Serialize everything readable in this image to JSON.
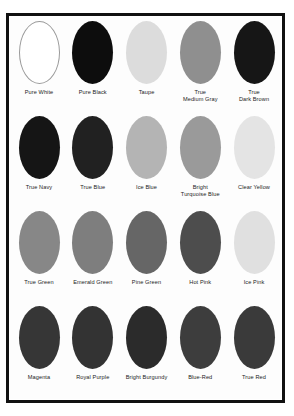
{
  "page": {
    "kind": "color-swatch-chart",
    "frame_color": "#111111",
    "background_color": "#ffffff",
    "label_color": "#1c1c1c"
  },
  "chart_data": {
    "type": "table",
    "title": "",
    "xlabel": "",
    "ylabel": "",
    "layout": {
      "rows": 4,
      "columns": 5,
      "swatch_shape": "ellipse"
    },
    "rows": [
      {
        "swatches": [
          {
            "label": "Pure White",
            "color": "#ffffff",
            "outlined": true
          },
          {
            "label": "Pure Black",
            "color": "#0d0d0d",
            "outlined": false
          },
          {
            "label": "Taupe",
            "color": "#dcdcdc",
            "outlined": false
          },
          {
            "label": "True\nMedium Gray",
            "color": "#8f8f8f",
            "outlined": false
          },
          {
            "label": "True\nDark Brown",
            "color": "#161616",
            "outlined": false
          }
        ]
      },
      {
        "swatches": [
          {
            "label": "True Navy",
            "color": "#151515",
            "outlined": false
          },
          {
            "label": "True Blue",
            "color": "#212121",
            "outlined": false
          },
          {
            "label": "Ice Blue",
            "color": "#b4b4b4",
            "outlined": false
          },
          {
            "label": "Bright\nTurquoise Blue",
            "color": "#9a9a9a",
            "outlined": false
          },
          {
            "label": "Clear Yellow",
            "color": "#e4e4e4",
            "outlined": false
          }
        ]
      },
      {
        "swatches": [
          {
            "label": "True Green",
            "color": "#878787",
            "outlined": false
          },
          {
            "label": "Emerald Green",
            "color": "#7e7e7e",
            "outlined": false
          },
          {
            "label": "Pine Green",
            "color": "#666666",
            "outlined": false
          },
          {
            "label": "Hot Pink",
            "color": "#4d4d4d",
            "outlined": false
          },
          {
            "label": "Ice Pink",
            "color": "#e0e0e0",
            "outlined": false
          }
        ]
      },
      {
        "swatches": [
          {
            "label": "Magenta",
            "color": "#363636",
            "outlined": false
          },
          {
            "label": "Royal Purple",
            "color": "#333333",
            "outlined": false
          },
          {
            "label": "Bright Burgundy",
            "color": "#2b2b2b",
            "outlined": false
          },
          {
            "label": "Blue-Red",
            "color": "#3d3d3d",
            "outlined": false
          },
          {
            "label": "True Red",
            "color": "#3a3a3a",
            "outlined": false
          }
        ]
      }
    ]
  }
}
